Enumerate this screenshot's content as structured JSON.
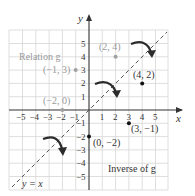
{
  "figure": {
    "relation_label": "Relation g",
    "inverse_label": "Inverse of g",
    "line_label": "y = x",
    "x_axis_label": "x",
    "y_axis_label": "y",
    "x_ticks": [
      "−5",
      "−4",
      "−3",
      "−2",
      "−1",
      "1",
      "2",
      "3",
      "4",
      "5"
    ],
    "y_ticks": [
      "5",
      "4",
      "3",
      "2",
      "1",
      "−1",
      "−2",
      "−3",
      "−4",
      "−5"
    ],
    "relation_points": [
      {
        "label": "(2, 4)",
        "x": 2,
        "y": 4
      },
      {
        "label": "(−1, 3)",
        "x": -1,
        "y": 3
      },
      {
        "label": "(−2, 0)",
        "x": -2,
        "y": 0
      }
    ],
    "inverse_points": [
      {
        "label": "(4, 2)",
        "x": 4,
        "y": 2
      },
      {
        "label": "(3, −1)",
        "x": 3,
        "y": -1
      },
      {
        "label": "(0, −2)",
        "x": 0,
        "y": -2
      }
    ],
    "colors": {
      "grid": "#d4d4d4",
      "axis": "#333333",
      "relation_point": "#a0a0a0",
      "inverse_point": "#111111",
      "arrow": "#2b2b2b",
      "dashed_line": "#555555"
    }
  }
}
